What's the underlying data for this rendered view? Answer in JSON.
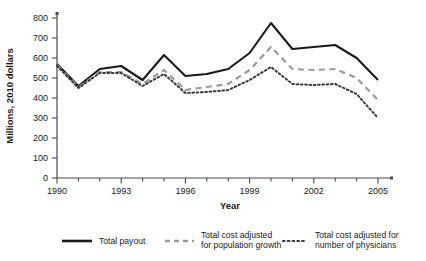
{
  "chart_data": {
    "type": "line",
    "title": "",
    "xlabel": "Year",
    "ylabel": "Millions, 2010 dollars",
    "xlim": [
      1990,
      2005
    ],
    "ylim": [
      0,
      800
    ],
    "grid": false,
    "legend_position": "bottom",
    "x": [
      1990,
      1991,
      1992,
      1993,
      1994,
      1995,
      1996,
      1997,
      1998,
      1999,
      2000,
      2001,
      2002,
      2003,
      2004,
      2005
    ],
    "xticks": [
      1990,
      1993,
      1996,
      1999,
      2002,
      2005
    ],
    "xtick_labels": [
      "1990",
      "1993",
      "1996",
      "1999",
      "2002",
      "2005"
    ],
    "yticks": [
      0,
      100,
      200,
      300,
      400,
      500,
      600,
      700,
      800
    ],
    "ytick_labels": [
      "0",
      "100",
      "200",
      "300",
      "400",
      "500",
      "600",
      "700",
      "800"
    ],
    "series": [
      {
        "name": "Total payout",
        "style": "solid",
        "color": "#1a1a1a",
        "values": [
          570,
          460,
          545,
          560,
          490,
          615,
          510,
          520,
          545,
          625,
          775,
          645,
          655,
          665,
          600,
          490
        ]
      },
      {
        "name": "Total cost adjusted for population growth",
        "style": "dashed",
        "color": "#9a9a9a",
        "values": [
          565,
          455,
          530,
          530,
          470,
          540,
          440,
          455,
          470,
          540,
          655,
          545,
          540,
          545,
          500,
          390
        ]
      },
      {
        "name": "Total cost adjusted for number of physicians",
        "style": "dotted",
        "color": "#3a3a3a",
        "values": [
          560,
          450,
          525,
          525,
          460,
          520,
          425,
          430,
          440,
          490,
          555,
          470,
          465,
          470,
          420,
          300
        ]
      }
    ]
  },
  "legend": {
    "items": [
      {
        "label": "Total payout",
        "label_line2": ""
      },
      {
        "label": "Total cost adjusted",
        "label_line2": "for population growth"
      },
      {
        "label": "Total cost adjusted for",
        "label_line2": "number of physicians"
      }
    ]
  }
}
